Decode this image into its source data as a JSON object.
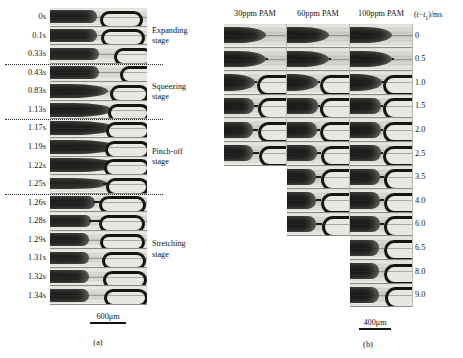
{
  "figure": {
    "type": "two-panel microscopy time-sequence figure",
    "panels": [
      {
        "id": "a",
        "caption": "(a)",
        "scalebar": "600μm",
        "time_unit": "s",
        "frames": [
          {
            "time": "0s",
            "stage": "Expanding"
          },
          {
            "time": "0.1s",
            "stage": "Expanding"
          },
          {
            "time": "0.33s",
            "stage": "Expanding"
          },
          {
            "time": "0.43s",
            "stage": "Squeezing"
          },
          {
            "time": "0.83s",
            "stage": "Squeezing"
          },
          {
            "time": "1.13s",
            "stage": "Squeezing"
          },
          {
            "time": "1.17s",
            "stage": "Pinch-off"
          },
          {
            "time": "1.19s",
            "stage": "Pinch-off"
          },
          {
            "time": "1.22s",
            "stage": "Pinch-off"
          },
          {
            "time": "1.25s",
            "stage": "Pinch-off"
          },
          {
            "time": "1.26s",
            "stage": "Stretching"
          },
          {
            "time": "1.28s",
            "stage": "Stretching"
          },
          {
            "time": "1.29s",
            "stage": "Stretching"
          },
          {
            "time": "1.31s",
            "stage": "Stretching"
          },
          {
            "time": "1.32s",
            "stage": "Stretching"
          },
          {
            "time": "1.34s",
            "stage": "Stretching"
          }
        ],
        "stage_labels": [
          {
            "line1": "Expanding",
            "line2": "stage"
          },
          {
            "line1": "Squeezing",
            "line2": "stage"
          },
          {
            "line1": "Pinch-off",
            "line2": "stage"
          },
          {
            "line1": "Stretching",
            "line2": "stage"
          }
        ],
        "divider_count": 3
      },
      {
        "id": "b",
        "caption": "(b)",
        "scalebar": "400μm",
        "axis_label": "(t−t₁)/ms",
        "columns": [
          {
            "header": "30ppm PAM",
            "concentration": 30,
            "frame_count": 6
          },
          {
            "header": "60ppm PAM",
            "concentration": 60,
            "frame_count": 9
          },
          {
            "header": "100ppm PAM",
            "concentration": 100,
            "frame_count": 12
          }
        ],
        "times": [
          "0",
          "0.5",
          "1.0",
          "1.5",
          "2.0",
          "2.5",
          "3.5",
          "4.0",
          "6.0",
          "6.5",
          "8.0",
          "9.0"
        ]
      }
    ]
  }
}
